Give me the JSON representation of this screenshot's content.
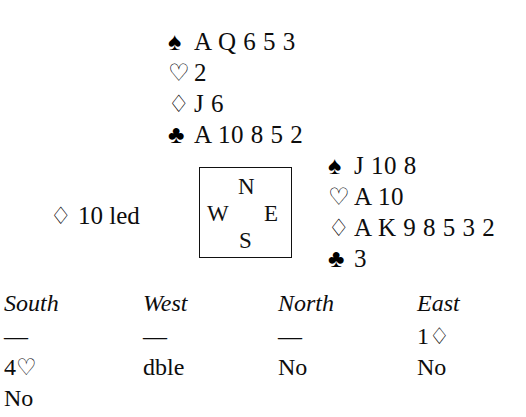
{
  "suits": {
    "spade": "♠",
    "heart": "♡",
    "diamond": "♢",
    "club": "♣"
  },
  "hands": {
    "north": {
      "position_label": "North",
      "rows": [
        {
          "suit_name": "spade",
          "suit": "♠",
          "cards": "A Q 6 5 3"
        },
        {
          "suit_name": "heart",
          "suit": "♡",
          "cards": "2"
        },
        {
          "suit_name": "diamond",
          "suit": "♢",
          "cards": "J 6"
        },
        {
          "suit_name": "club",
          "suit": "♣",
          "cards": "A 10 8 5 2"
        }
      ]
    },
    "east": {
      "position_label": "East",
      "rows": [
        {
          "suit_name": "spade",
          "suit": "♠",
          "cards": "J 10 8"
        },
        {
          "suit_name": "heart",
          "suit": "♡",
          "cards": "A 10"
        },
        {
          "suit_name": "diamond",
          "suit": "♢",
          "cards": "A K 9 8 5 3 2"
        },
        {
          "suit_name": "club",
          "suit": "♣",
          "cards": "3"
        }
      ]
    }
  },
  "compass": {
    "north": "N",
    "west": "W",
    "east": "E",
    "south": "S"
  },
  "lead": {
    "suit": "♢",
    "text": "10 led"
  },
  "bidding": {
    "headers": [
      "South",
      "West",
      "North",
      "East"
    ],
    "rows": [
      [
        {
          "value": "—",
          "type": "dash"
        },
        {
          "value": "—",
          "type": "dash"
        },
        {
          "value": "—",
          "type": "dash"
        },
        {
          "value": "1",
          "suit": "♢",
          "type": "bid"
        }
      ],
      [
        {
          "value": "4",
          "suit": "♡",
          "type": "bid"
        },
        {
          "value": "dble",
          "type": "call"
        },
        {
          "value": "No",
          "type": "call"
        },
        {
          "value": "No",
          "type": "call"
        }
      ],
      [
        {
          "value": "No",
          "type": "call"
        },
        {
          "value": "",
          "type": "empty"
        },
        {
          "value": "",
          "type": "empty"
        },
        {
          "value": "",
          "type": "empty"
        }
      ]
    ]
  },
  "colors": {
    "ink": "#0d0d0d",
    "background": "#ffffff",
    "box_border": "#111111"
  }
}
